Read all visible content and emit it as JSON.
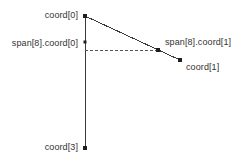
{
  "figure": {
    "width": 248,
    "height": 167,
    "background_color": "#ffffff",
    "stroke_color": "#3a3a3a",
    "text_color": "#333333"
  },
  "labels": {
    "coord0": "coord[0]",
    "span_coord0": "span[8].coord[0]",
    "span_coord1": "span[8].coord[1]",
    "coord1": "coord[1]",
    "coord3": "coord[3]"
  },
  "chart_data": {
    "type": "scatter",
    "title": "",
    "xlabel": "",
    "ylabel": "",
    "grid": false,
    "legend": null,
    "xlim": [
      0,
      248
    ],
    "ylim": [
      167,
      0
    ],
    "points": [
      {
        "name": "coord[0]",
        "x": 85,
        "y": 16,
        "marker": "square",
        "size": 4
      },
      {
        "name": "span[8].coord[0]",
        "x": 85,
        "y": 42,
        "marker": "square",
        "size": 3
      },
      {
        "name": "span[8].coord[1]",
        "x": 158,
        "y": 50,
        "marker": "square",
        "size": 4
      },
      {
        "name": "coord[1]",
        "x": 180,
        "y": 60,
        "marker": "square",
        "size": 4
      },
      {
        "name": "coord[3]",
        "x": 85,
        "y": 148,
        "marker": "square",
        "size": 4
      }
    ],
    "segments": [
      {
        "name": "edge-coord0-to-coord1",
        "x1": 85,
        "y1": 16,
        "x2": 180,
        "y2": 60,
        "style": "solid"
      },
      {
        "name": "edge-coord0-to-coord3",
        "x1": 85,
        "y1": 16,
        "x2": 85,
        "y2": 148,
        "style": "solid"
      },
      {
        "name": "span-baseline",
        "x1": 85,
        "y1": 50,
        "x2": 158,
        "y2": 50,
        "style": "dashed"
      }
    ]
  }
}
